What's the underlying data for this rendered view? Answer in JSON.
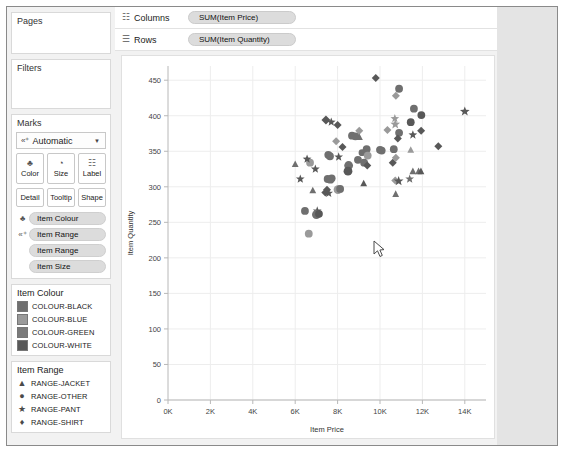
{
  "sidebar": {
    "pages": {
      "title": "Pages"
    },
    "filters": {
      "title": "Filters"
    },
    "marks": {
      "title": "Marks",
      "type_icon": "abc-plus-icon",
      "type_label": "Automatic",
      "dropdown_arrow": "▼",
      "buttons": [
        {
          "name": "color",
          "label": "Color",
          "icon": "♣"
        },
        {
          "name": "size",
          "label": "Size",
          "icon": "◔"
        },
        {
          "name": "label",
          "label": "Label",
          "icon": "☷"
        }
      ],
      "buttons2": [
        {
          "name": "detail",
          "label": "Detail"
        },
        {
          "name": "tooltip",
          "label": "Tooltip"
        },
        {
          "name": "shape",
          "label": "Shape"
        }
      ],
      "pills": [
        {
          "icon": "♣",
          "label": "Item Colour"
        },
        {
          "icon": "«⁺",
          "label": "Item Range"
        },
        {
          "icon": "",
          "label": "Item Range"
        },
        {
          "icon": "",
          "label": "Item Size"
        }
      ]
    },
    "legend_colour": {
      "title": "Item Colour",
      "items": [
        {
          "label": "COLOUR-BLACK",
          "color": "#6f6f6f"
        },
        {
          "label": "COLOUR-BLUE",
          "color": "#9a9a9a"
        },
        {
          "label": "COLOUR-GREEN",
          "color": "#7a7a7a"
        },
        {
          "label": "COLOUR-WHITE",
          "color": "#585858"
        }
      ]
    },
    "legend_range": {
      "title": "Item Range",
      "items": [
        {
          "label": "RANGE-JACKET",
          "glyph": "▲",
          "shape": "triangle"
        },
        {
          "label": "RANGE-OTHER",
          "glyph": "●",
          "shape": "circle"
        },
        {
          "label": "RANGE-PANT",
          "glyph": "★",
          "shape": "star"
        },
        {
          "label": "RANGE-SHIRT",
          "glyph": "♦",
          "shape": "diamond"
        }
      ]
    }
  },
  "shelves": [
    {
      "name": "columns",
      "icon": "☷",
      "label": "Columns",
      "pill": "SUM(Item Price)"
    },
    {
      "name": "rows",
      "icon": "☰",
      "label": "Rows",
      "pill": "SUM(Item Quantity)"
    }
  ],
  "cursor": {
    "x": 372,
    "y": 235
  },
  "chart_data": {
    "type": "scatter",
    "title": "",
    "xlabel": "Item Price",
    "ylabel": "Item Quantity",
    "xlim": [
      0,
      15000
    ],
    "ylim": [
      0,
      470
    ],
    "xticks": [
      0,
      2000,
      4000,
      6000,
      8000,
      10000,
      12000,
      14000
    ],
    "xticklabels": [
      "0K",
      "2K",
      "4K",
      "6K",
      "8K",
      "10K",
      "12K",
      "14K"
    ],
    "yticks": [
      0,
      50,
      100,
      150,
      200,
      250,
      300,
      350,
      400,
      450
    ],
    "yticklabels": [
      "0",
      "50",
      "100",
      "150",
      "200",
      "250",
      "300",
      "350",
      "400",
      "450"
    ],
    "grid": true,
    "legend_position": "right-sidebar",
    "shape_legend": [
      "RANGE-JACKET",
      "RANGE-OTHER",
      "RANGE-PANT",
      "RANGE-SHIRT"
    ],
    "colors": [
      "#6f6f6f",
      "#9a9a9a",
      "#7a7a7a",
      "#585858"
    ],
    "points": [
      {
        "x": 9800,
        "y": 453,
        "shape": "diamond",
        "color": "#585858",
        "size": 6
      },
      {
        "x": 10900,
        "y": 438,
        "shape": "circle",
        "color": "#6f6f6f",
        "size": 7
      },
      {
        "x": 10750,
        "y": 428,
        "shape": "diamond",
        "color": "#9a9a9a",
        "size": 6
      },
      {
        "x": 11600,
        "y": 410,
        "shape": "circle",
        "color": "#6f6f6f",
        "size": 7
      },
      {
        "x": 14000,
        "y": 406,
        "shape": "star",
        "color": "#585858",
        "size": 7
      },
      {
        "x": 11950,
        "y": 401,
        "shape": "circle",
        "color": "#585858",
        "size": 7
      },
      {
        "x": 10700,
        "y": 396,
        "shape": "star",
        "color": "#9a9a9a",
        "size": 6
      },
      {
        "x": 10720,
        "y": 388,
        "shape": "star",
        "color": "#9a9a9a",
        "size": 7
      },
      {
        "x": 11450,
        "y": 391,
        "shape": "circle",
        "color": "#585858",
        "size": 7
      },
      {
        "x": 7450,
        "y": 394,
        "shape": "diamond",
        "color": "#585858",
        "size": 7
      },
      {
        "x": 7700,
        "y": 391,
        "shape": "star",
        "color": "#585858",
        "size": 6
      },
      {
        "x": 8000,
        "y": 387,
        "shape": "diamond",
        "color": "#585858",
        "size": 6
      },
      {
        "x": 11940,
        "y": 379,
        "shape": "diamond",
        "color": "#585858",
        "size": 6
      },
      {
        "x": 10350,
        "y": 380,
        "shape": "diamond",
        "color": "#9a9a9a",
        "size": 6
      },
      {
        "x": 9020,
        "y": 379,
        "shape": "diamond",
        "color": "#9a9a9a",
        "size": 6
      },
      {
        "x": 11550,
        "y": 373,
        "shape": "star",
        "color": "#585858",
        "size": 6
      },
      {
        "x": 10900,
        "y": 376,
        "shape": "circle",
        "color": "#6f6f6f",
        "size": 7
      },
      {
        "x": 10840,
        "y": 368,
        "shape": "diamond",
        "color": "#585858",
        "size": 6
      },
      {
        "x": 8680,
        "y": 372,
        "shape": "circle",
        "color": "#6f6f6f",
        "size": 7
      },
      {
        "x": 8840,
        "y": 371,
        "shape": "circle",
        "color": "#6f6f6f",
        "size": 7
      },
      {
        "x": 9030,
        "y": 370,
        "shape": "triangle",
        "color": "#6f6f6f",
        "size": 6
      },
      {
        "x": 7930,
        "y": 364,
        "shape": "diamond",
        "color": "#9a9a9a",
        "size": 6
      },
      {
        "x": 12750,
        "y": 357,
        "shape": "diamond",
        "color": "#585858",
        "size": 6
      },
      {
        "x": 8230,
        "y": 356,
        "shape": "diamond",
        "color": "#585858",
        "size": 6
      },
      {
        "x": 9370,
        "y": 353,
        "shape": "circle",
        "color": "#6f6f6f",
        "size": 7
      },
      {
        "x": 10000,
        "y": 352,
        "shape": "circle",
        "color": "#6f6f6f",
        "size": 7
      },
      {
        "x": 10080,
        "y": 351,
        "shape": "circle",
        "color": "#6f6f6f",
        "size": 7
      },
      {
        "x": 10650,
        "y": 353,
        "shape": "circle",
        "color": "#6f6f6f",
        "size": 7
      },
      {
        "x": 11450,
        "y": 352,
        "shape": "triangle",
        "color": "#9a9a9a",
        "size": 6
      },
      {
        "x": 9150,
        "y": 348,
        "shape": "circle",
        "color": "#6f6f6f",
        "size": 6
      },
      {
        "x": 9420,
        "y": 344,
        "shape": "circle",
        "color": "#9a9a9a",
        "size": 7
      },
      {
        "x": 7560,
        "y": 345,
        "shape": "circle",
        "color": "#6f6f6f",
        "size": 7
      },
      {
        "x": 7640,
        "y": 343,
        "shape": "circle",
        "color": "#6f6f6f",
        "size": 7
      },
      {
        "x": 8050,
        "y": 342,
        "shape": "star",
        "color": "#585858",
        "size": 6
      },
      {
        "x": 10750,
        "y": 341,
        "shape": "diamond",
        "color": "#9a9a9a",
        "size": 6
      },
      {
        "x": 10600,
        "y": 334,
        "shape": "diamond",
        "color": "#585858",
        "size": 6
      },
      {
        "x": 8960,
        "y": 338,
        "shape": "circle",
        "color": "#6f6f6f",
        "size": 7
      },
      {
        "x": 9250,
        "y": 334,
        "shape": "circle",
        "color": "#6f6f6f",
        "size": 7
      },
      {
        "x": 9400,
        "y": 330,
        "shape": "diamond",
        "color": "#585858",
        "size": 6
      },
      {
        "x": 8520,
        "y": 330,
        "shape": "circle",
        "color": "#6f6f6f",
        "size": 8
      },
      {
        "x": 8490,
        "y": 322,
        "shape": "circle",
        "color": "#585858",
        "size": 8
      },
      {
        "x": 6000,
        "y": 332,
        "shape": "triangle",
        "color": "#6f6f6f",
        "size": 6
      },
      {
        "x": 6700,
        "y": 334,
        "shape": "circle",
        "color": "#9a9a9a",
        "size": 7
      },
      {
        "x": 6560,
        "y": 339,
        "shape": "star",
        "color": "#585858",
        "size": 6
      },
      {
        "x": 6950,
        "y": 325,
        "shape": "star",
        "color": "#585858",
        "size": 6
      },
      {
        "x": 11550,
        "y": 322,
        "shape": "triangle",
        "color": "#6f6f6f",
        "size": 6
      },
      {
        "x": 11820,
        "y": 322,
        "shape": "triangle",
        "color": "#6f6f6f",
        "size": 6
      },
      {
        "x": 11930,
        "y": 322,
        "shape": "triangle",
        "color": "#585858",
        "size": 6
      },
      {
        "x": 6240,
        "y": 311,
        "shape": "star",
        "color": "#585858",
        "size": 6
      },
      {
        "x": 7530,
        "y": 311,
        "shape": "circle",
        "color": "#6f6f6f",
        "size": 7
      },
      {
        "x": 7660,
        "y": 310,
        "shape": "circle",
        "color": "#6f6f6f",
        "size": 7
      },
      {
        "x": 7720,
        "y": 312,
        "shape": "circle",
        "color": "#6f6f6f",
        "size": 7
      },
      {
        "x": 10720,
        "y": 309,
        "shape": "diamond",
        "color": "#9a9a9a",
        "size": 6
      },
      {
        "x": 10880,
        "y": 308,
        "shape": "star",
        "color": "#585858",
        "size": 7
      },
      {
        "x": 11400,
        "y": 311,
        "shape": "star",
        "color": "#6f6f6f",
        "size": 6
      },
      {
        "x": 9230,
        "y": 305,
        "shape": "triangle",
        "color": "#585858",
        "size": 6
      },
      {
        "x": 6830,
        "y": 295,
        "shape": "triangle",
        "color": "#6f6f6f",
        "size": 6
      },
      {
        "x": 7420,
        "y": 292,
        "shape": "diamond",
        "color": "#585858",
        "size": 6
      },
      {
        "x": 7500,
        "y": 296,
        "shape": "diamond",
        "color": "#585858",
        "size": 6
      },
      {
        "x": 7580,
        "y": 291,
        "shape": "star",
        "color": "#585858",
        "size": 6
      },
      {
        "x": 8020,
        "y": 296,
        "shape": "circle",
        "color": "#9a9a9a",
        "size": 8
      },
      {
        "x": 8120,
        "y": 297,
        "shape": "circle",
        "color": "#6f6f6f",
        "size": 7
      },
      {
        "x": 10740,
        "y": 290,
        "shape": "triangle",
        "color": "#6f6f6f",
        "size": 6
      },
      {
        "x": 7040,
        "y": 266,
        "shape": "star",
        "color": "#585858",
        "size": 6
      },
      {
        "x": 6460,
        "y": 266,
        "shape": "circle",
        "color": "#6f6f6f",
        "size": 7
      },
      {
        "x": 7000,
        "y": 261,
        "shape": "circle",
        "color": "#6f6f6f",
        "size": 8
      },
      {
        "x": 7120,
        "y": 262,
        "shape": "circle",
        "color": "#585858",
        "size": 7
      },
      {
        "x": 6640,
        "y": 234,
        "shape": "circle",
        "color": "#9a9a9a",
        "size": 7
      }
    ]
  }
}
